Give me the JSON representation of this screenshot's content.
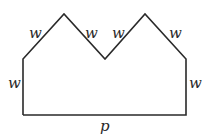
{
  "diagram": {
    "shape": "pentagon-like polygon with two triangular peaks (crown shape)",
    "vertices": [
      [
        23,
        115
      ],
      [
        23,
        59
      ],
      [
        64,
        14
      ],
      [
        105,
        59
      ],
      [
        145,
        14
      ],
      [
        186,
        59
      ],
      [
        186,
        115
      ]
    ],
    "stroke_color": "#2a2a2a",
    "labels": {
      "left_side": "w",
      "peak1_left": "w",
      "peak1_right": "w",
      "peak2_left": "w",
      "peak2_right": "w",
      "right_side": "w",
      "bottom": "p"
    }
  }
}
